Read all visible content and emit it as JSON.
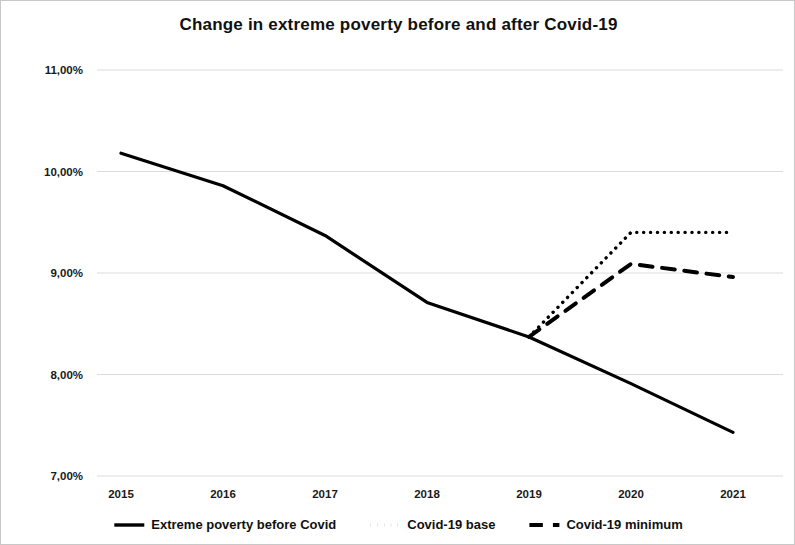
{
  "chart_data": {
    "type": "line",
    "title": "Change in extreme poverty before and after Covid-19",
    "xlabel": "",
    "ylabel": "",
    "x": [
      2015,
      2016,
      2017,
      2018,
      2019,
      2020,
      2021
    ],
    "categories": [
      "2015",
      "2016",
      "2017",
      "2018",
      "2019",
      "2020",
      "2021"
    ],
    "ytick_labels": [
      "11,00%",
      "10,00%",
      "9,00%",
      "8,00%",
      "7,00%"
    ],
    "ytick_values": [
      11.0,
      10.0,
      9.0,
      8.0,
      7.0
    ],
    "ylim": [
      7.0,
      11.0
    ],
    "xlim": [
      2015,
      2021
    ],
    "grid": true,
    "legend_position": "bottom",
    "series": [
      {
        "name": "Extreme poverty before Covid",
        "style": "solid",
        "x": [
          2015,
          2016,
          2017,
          2018,
          2019,
          2020,
          2021
        ],
        "values": [
          10.18,
          9.86,
          9.37,
          8.71,
          8.37,
          7.91,
          7.43
        ]
      },
      {
        "name": "Covid-19 base",
        "style": "dotted",
        "x": [
          2019,
          2020,
          2021
        ],
        "values": [
          8.37,
          9.4,
          9.4
        ]
      },
      {
        "name": "Covid-19 minimum",
        "style": "dashed",
        "x": [
          2019,
          2020,
          2021
        ],
        "values": [
          8.37,
          9.09,
          8.96
        ]
      }
    ],
    "colors": {
      "line": "#000000",
      "grid": "#dcdcdc",
      "text": "#111111",
      "background": "#ffffff"
    }
  },
  "legend": {
    "items": [
      {
        "label": "Extreme poverty before Covid",
        "style": "solid"
      },
      {
        "label": "Covid-19 base",
        "style": "dotted"
      },
      {
        "label": "Covid-19 minimum",
        "style": "dashed"
      }
    ]
  }
}
